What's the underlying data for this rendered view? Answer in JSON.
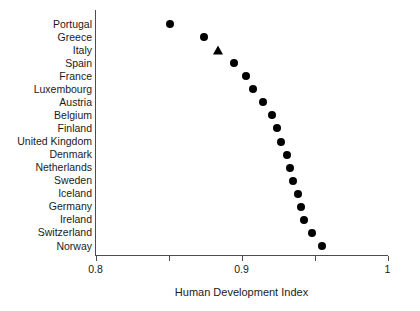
{
  "chart_data": {
    "type": "scatter",
    "title": "",
    "xlabel": "Human Development Index",
    "ylabel": "",
    "xlim": [
      0.8,
      1.0
    ],
    "xticks": [
      0.8,
      0.85,
      0.9,
      0.95,
      1.0
    ],
    "xticklabels": [
      "0.8",
      "",
      "0.9",
      "",
      "1"
    ],
    "grid": false,
    "legend": null,
    "orientation": "horizontal",
    "categories": [
      "Portugal",
      "Greece",
      "Italy",
      "Spain",
      "France",
      "Luxembourg",
      "Austria",
      "Belgium",
      "Finland",
      "United Kingdom",
      "Denmark",
      "Netherlands",
      "Sweden",
      "Iceland",
      "Germany",
      "Ireland",
      "Switzerland",
      "Norway"
    ],
    "values": [
      0.851,
      0.874,
      0.884,
      0.895,
      0.903,
      0.908,
      0.915,
      0.921,
      0.924,
      0.927,
      0.931,
      0.933,
      0.935,
      0.939,
      0.941,
      0.943,
      0.948,
      0.955
    ],
    "markers": [
      "circle",
      "circle",
      "triangle",
      "circle",
      "circle",
      "circle",
      "circle",
      "circle",
      "circle",
      "circle",
      "circle",
      "circle",
      "circle",
      "circle",
      "circle",
      "circle",
      "circle",
      "circle"
    ],
    "marker_color": "#000000",
    "axis_color": "#4d4d4d",
    "text_color": "#1a1a1a"
  }
}
